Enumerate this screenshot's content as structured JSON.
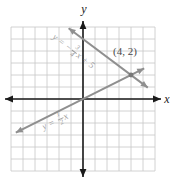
{
  "figure": {
    "colors": {
      "axis": "#1a1a1a",
      "grid": "#c7c7c7",
      "line": "#8f8f8f",
      "equation_label": "#9c9c9c",
      "point": "#787878",
      "point_label": "#4a4a4a"
    }
  },
  "chart_data": {
    "type": "line",
    "title": "",
    "xlabel": "x",
    "ylabel": "y",
    "xlim": [
      -6,
      6
    ],
    "ylim": [
      -6,
      6
    ],
    "grid": true,
    "legend": "none",
    "series": [
      {
        "name": "y = -3/4x + 5",
        "slope": -0.75,
        "intercept": 5,
        "x_start": -1.2,
        "x_end": 5.4,
        "label_parts": {
          "pre": "y = −",
          "num": "3",
          "den": "4",
          "post": "x + 5"
        },
        "label_pos": {
          "x": 74,
          "y": 51,
          "angle": 38
        }
      },
      {
        "name": "y = 1/2x",
        "slope": 0.5,
        "intercept": 0,
        "x_start": -5.6,
        "x_end": 5.1,
        "label_parts": {
          "pre": "y = ",
          "num": "1",
          "den": "2",
          "post": "x"
        },
        "label_pos": {
          "x": 55,
          "y": 121,
          "angle": -25
        }
      }
    ],
    "point": {
      "x": 4,
      "y": 2,
      "label": "(4, 2)",
      "label_pos": {
        "x": 125,
        "y": 51
      }
    }
  }
}
